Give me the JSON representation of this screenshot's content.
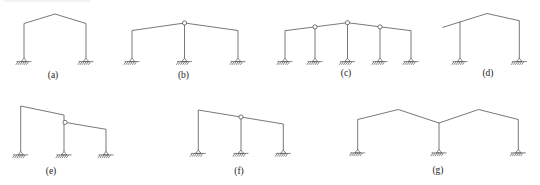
{
  "figure": {
    "background": "#ffffff",
    "line_color": "#555555",
    "label_color": "#222222",
    "hinge_fill": "#ffffff",
    "frames": [
      {
        "id": "a",
        "label": "(a)",
        "label_pos": [
          53,
          77.5
        ],
        "members": [
          [
            [
              24,
              58.2
            ],
            [
              24,
              23.5
            ],
            [
              55,
              14
            ],
            [
              86,
              23.5
            ],
            [
              86,
              58.2
            ]
          ]
        ],
        "hinges": [],
        "supports": [
          [
            24,
            58.2
          ],
          [
            86,
            58.2
          ]
        ]
      },
      {
        "id": "b",
        "label": "(b)",
        "label_pos": [
          183.5,
          77.5
        ],
        "members": [
          [
            [
              132,
              58.2
            ],
            [
              132,
              30.5
            ],
            [
              184.5,
              23
            ],
            [
              238,
              30.5
            ],
            [
              238,
              58.2
            ]
          ],
          [
            [
              184.5,
              23
            ],
            [
              184.5,
              58.2
            ]
          ]
        ],
        "hinges": [
          [
            184.5,
            23
          ]
        ],
        "supports": [
          [
            132,
            58.2
          ],
          [
            184.5,
            58.2
          ],
          [
            238,
            58.2
          ]
        ]
      },
      {
        "id": "c",
        "label": "(c)",
        "label_pos": [
          346,
          76
        ],
        "members": [
          [
            [
              285,
              58.2
            ],
            [
              285,
              30.7
            ],
            [
              347.5,
              22.7
            ],
            [
              411,
              30.7
            ],
            [
              411,
              58.2
            ]
          ],
          [
            [
              315,
              26.9
            ],
            [
              315,
              58.2
            ]
          ],
          [
            [
              347.5,
              22.7
            ],
            [
              347.5,
              58.2
            ]
          ],
          [
            [
              380,
              26.9
            ],
            [
              380,
              58.2
            ]
          ]
        ],
        "hinges": [
          [
            315,
            26.9
          ],
          [
            347.5,
            22.7
          ],
          [
            380,
            26.9
          ]
        ],
        "supports": [
          [
            285,
            58.2
          ],
          [
            315,
            58.2
          ],
          [
            347.5,
            58.2
          ],
          [
            380,
            58.2
          ],
          [
            411,
            58.2
          ]
        ]
      },
      {
        "id": "d",
        "label": "(d)",
        "label_pos": [
          488,
          75.5
        ],
        "members": [
          [
            [
              443,
              27.3
            ],
            [
              487,
              13.5
            ],
            [
              519.3,
              20.7
            ],
            [
              519.3,
              58.2
            ]
          ],
          [
            [
              460,
              22
            ],
            [
              460,
              58.2
            ]
          ]
        ],
        "hinges": [],
        "supports": [
          [
            460,
            58.2
          ],
          [
            519.3,
            58.2
          ]
        ]
      },
      {
        "id": "e",
        "label": "(e)",
        "label_pos": [
          51,
          173.5
        ],
        "members": [
          [
            [
              20.7,
              151.5
            ],
            [
              20.7,
              106
            ],
            [
              64,
              115
            ],
            [
              64,
              151.5
            ]
          ],
          [
            [
              65,
              122.4
            ],
            [
              106,
              129.3
            ],
            [
              106,
              151.5
            ]
          ]
        ],
        "hinges": [
          [
            65,
            122.4
          ]
        ],
        "supports": [
          [
            20.7,
            151.5
          ],
          [
            64,
            151.5
          ],
          [
            106,
            151.5
          ]
        ]
      },
      {
        "id": "f",
        "label": "(f)",
        "label_pos": [
          239,
          173.5
        ],
        "members": [
          [
            [
              198.3,
              150
            ],
            [
              198.3,
              110
            ],
            [
              283.3,
              124
            ],
            [
              283.3,
              150
            ]
          ],
          [
            [
              241,
              117
            ],
            [
              241,
              150
            ]
          ]
        ],
        "hinges": [
          [
            241,
            117
          ]
        ],
        "supports": [
          [
            198.3,
            150
          ],
          [
            241,
            150
          ],
          [
            283.3,
            150
          ]
        ]
      },
      {
        "id": "g",
        "label": "(g)",
        "label_pos": [
          438,
          173
        ],
        "members": [
          [
            [
              357.7,
              149.5
            ],
            [
              357.7,
              119.5
            ],
            [
              398.3,
              109.5
            ],
            [
              439,
              123
            ],
            [
              478.6,
              109.5
            ],
            [
              518.3,
              119.5
            ],
            [
              518.3,
              149.5
            ]
          ],
          [
            [
              439,
              123
            ],
            [
              439,
              149.5
            ]
          ]
        ],
        "hinges": [],
        "supports": [
          [
            357.7,
            149.5
          ],
          [
            439,
            149.5
          ],
          [
            518.3,
            149.5
          ]
        ]
      }
    ]
  }
}
